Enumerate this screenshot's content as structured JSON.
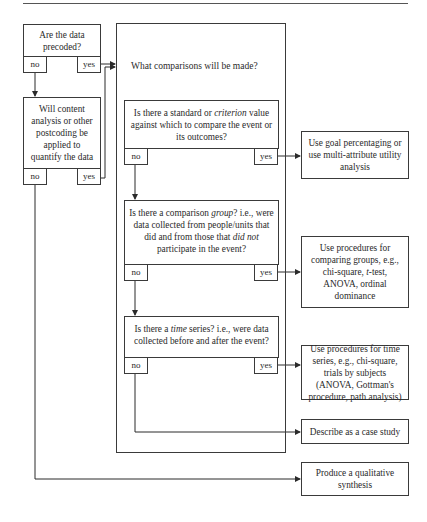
{
  "flowchart": {
    "precoded": {
      "question": "Are the data precoded?",
      "no": "no",
      "yes": "yes"
    },
    "postcoding": {
      "question": "Will content analysis or other postcoding be applied to quantify the data",
      "no": "no",
      "yes": "yes"
    },
    "comparisons": {
      "heading": "What comparisons will be made?"
    },
    "criterion": {
      "q_part1": "Is there a standard or ",
      "q_italic": "criterion",
      "q_part2": " value against which to compare the event or its outcomes?",
      "no": "no",
      "yes": "yes"
    },
    "group": {
      "q_part1": "Is there a comparison ",
      "q_italic1": "group",
      "q_part2": "? i.e., were data collected from people/units that did and from those that ",
      "q_italic2": "did not",
      "q_part3": " participate in the event?",
      "no": "no",
      "yes": "yes"
    },
    "time": {
      "q_part1": "Is there a ",
      "q_italic": "time",
      "q_part2": " series? i.e., were data collected before and after the event?",
      "no": "no",
      "yes": "yes"
    },
    "outcomes": {
      "goal": "Use goal percentaging or use multi-attribute utility analysis",
      "groups_part1": "Use procedures for comparing groups, e.g., chi-square, ",
      "groups_italic": "t",
      "groups_part2": "-test, ANOVA, ordinal dominance",
      "time_series": "Use procedures for time series, e.g., chi-square, trials by subjects (ANOVA, Gottman's procedure, path analysis)",
      "case_study": "Describe as a case study",
      "qualitative": "Produce a qualitative synthesis"
    }
  }
}
